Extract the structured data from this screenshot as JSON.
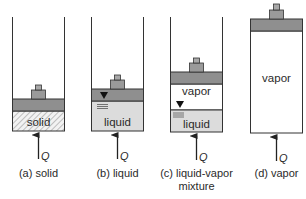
{
  "figure": {
    "panels": [
      {
        "id": "a",
        "caption": "(a) solid",
        "caption_line2": "",
        "content_label": "solid",
        "heat_label": "Q"
      },
      {
        "id": "b",
        "caption": "(b) liquid",
        "caption_line2": "",
        "content_label": "liquid",
        "heat_label": "Q"
      },
      {
        "id": "c",
        "caption": "(c) liquid-vapor",
        "caption_line2": "mixture",
        "upper_label": "vapor",
        "content_label": "liquid",
        "heat_label": "Q"
      },
      {
        "id": "d",
        "caption": "(d) vapor",
        "caption_line2": "",
        "content_label": "vapor",
        "heat_label": "Q"
      }
    ],
    "colors": {
      "outline": "#333333",
      "piston": "#8f8f8f",
      "weight": "#9a9a9a",
      "liquid": "#dcdcdc",
      "solid_hatch": "#9a9a9a",
      "vapor": "#ffffff"
    }
  }
}
